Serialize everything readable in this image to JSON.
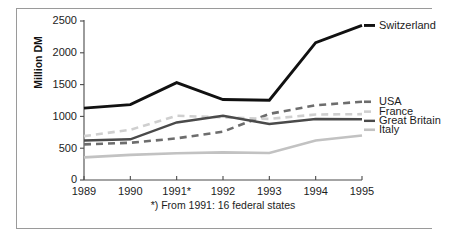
{
  "chart_data": {
    "type": "line",
    "title": "",
    "xlabel": "",
    "ylabel": "Million DM",
    "x": [
      "1989",
      "1990",
      "1991*",
      "1992",
      "1993",
      "1994",
      "1995"
    ],
    "xlim": [
      0,
      6
    ],
    "ylim": [
      0,
      2500
    ],
    "yticks": [
      0,
      500,
      1000,
      1500,
      2000,
      2500
    ],
    "ytick_labels": [
      "0",
      "500",
      "1000",
      "1500",
      "2000",
      "2500"
    ],
    "grid": false,
    "legend_position": "right-end-of-line",
    "footnote": "*) From 1991: 16 federal states",
    "series": [
      {
        "name": "Switzerland",
        "color": "#111111",
        "style": "solid",
        "width": 2.9,
        "values": [
          1130,
          1185,
          1530,
          1265,
          1255,
          2160,
          2430
        ]
      },
      {
        "name": "USA",
        "color": "#6d6d6d",
        "style": "dashed",
        "width": 2.6,
        "values": [
          560,
          585,
          655,
          760,
          1040,
          1175,
          1230
        ]
      },
      {
        "name": "France",
        "color": "#cfcfcf",
        "style": "dashed",
        "width": 2.6,
        "values": [
          690,
          790,
          1010,
          985,
          960,
          1030,
          1035
        ]
      },
      {
        "name": "Great Britain",
        "color": "#4a4a4a",
        "style": "solid",
        "width": 2.4,
        "values": [
          620,
          640,
          905,
          1010,
          880,
          960,
          955
        ]
      },
      {
        "name": "Italy",
        "color": "#c2c2c2",
        "style": "solid",
        "width": 2.6,
        "values": [
          355,
          395,
          420,
          435,
          425,
          620,
          700
        ]
      }
    ],
    "series_labels": [
      {
        "name": "Switzerland",
        "label_y": 2430
      },
      {
        "name": "USA",
        "label_y": 1230
      },
      {
        "name": "France",
        "label_y": 1075
      },
      {
        "name": "Great Britain",
        "label_y": 930
      },
      {
        "name": "Italy",
        "label_y": 790
      }
    ]
  }
}
